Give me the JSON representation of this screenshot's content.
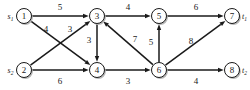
{
  "figure": {
    "type": "directed-weighted-graph",
    "colors": {
      "background": "#ffffff",
      "stroke": "#1a1a1a",
      "node_fill": "#ffffff",
      "shadow": "#b8b8b8"
    }
  },
  "nodes": [
    {
      "id": "1",
      "label": "1",
      "x": 24,
      "y": 16,
      "terminal": "s",
      "terminal_sub": "1",
      "terminal_side": "left"
    },
    {
      "id": "2",
      "label": "2",
      "x": 24,
      "y": 70,
      "terminal": "s",
      "terminal_sub": "2",
      "terminal_side": "left"
    },
    {
      "id": "3",
      "label": "3",
      "x": 97,
      "y": 16,
      "terminal": "",
      "terminal_sub": "",
      "terminal_side": ""
    },
    {
      "id": "4",
      "label": "4",
      "x": 97,
      "y": 70,
      "terminal": "",
      "terminal_sub": "",
      "terminal_side": ""
    },
    {
      "id": "5",
      "label": "5",
      "x": 159,
      "y": 16,
      "terminal": "",
      "terminal_sub": "",
      "terminal_side": ""
    },
    {
      "id": "6",
      "label": "6",
      "x": 159,
      "y": 70,
      "terminal": "",
      "terminal_sub": "",
      "terminal_side": ""
    },
    {
      "id": "7",
      "label": "7",
      "x": 232,
      "y": 16,
      "terminal": "t",
      "terminal_sub": "1",
      "terminal_side": "right"
    },
    {
      "id": "8",
      "label": "8",
      "x": 232,
      "y": 70,
      "terminal": "t",
      "terminal_sub": "2",
      "terminal_side": "right"
    }
  ],
  "edges": [
    {
      "from": "1",
      "to": "3",
      "weight": "5",
      "lx": 60,
      "ly": 7
    },
    {
      "from": "1",
      "to": "4",
      "weight": "4",
      "lx": 46,
      "ly": 29
    },
    {
      "from": "2",
      "to": "3",
      "weight": "3",
      "lx": 70,
      "ly": 29
    },
    {
      "from": "2",
      "to": "4",
      "weight": "6",
      "lx": 60,
      "ly": 81
    },
    {
      "from": "3",
      "to": "4",
      "weight": "3",
      "lx": 89,
      "ly": 40
    },
    {
      "from": "3",
      "to": "5",
      "weight": "4",
      "lx": 128,
      "ly": 7
    },
    {
      "from": "4",
      "to": "6",
      "weight": "3",
      "lx": 128,
      "ly": 81
    },
    {
      "from": "6",
      "to": "3",
      "weight": "7",
      "lx": 135,
      "ly": 39
    },
    {
      "from": "6",
      "to": "5",
      "weight": "5",
      "lx": 151,
      "ly": 42
    },
    {
      "from": "5",
      "to": "7",
      "weight": "6",
      "lx": 196,
      "ly": 7
    },
    {
      "from": "6",
      "to": "7",
      "weight": "8",
      "lx": 191,
      "ly": 41
    },
    {
      "from": "6",
      "to": "8",
      "weight": "4",
      "lx": 196,
      "ly": 81
    }
  ],
  "geometry": {
    "node_radius": 7.5,
    "shadow_offset_x": 1.4,
    "shadow_offset_y": 1.4,
    "arrow_size": 4.2
  }
}
